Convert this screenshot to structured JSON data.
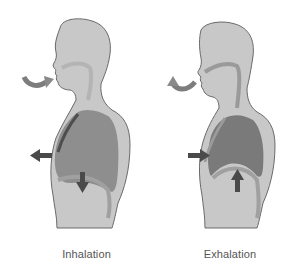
{
  "diagram": {
    "panels": [
      {
        "id": "inhalation",
        "caption": "Inhalation",
        "arrows": [
          {
            "name": "air-in",
            "direction": "into-mouth"
          },
          {
            "name": "ribcage",
            "direction": "outward"
          },
          {
            "name": "diaphragm",
            "direction": "down"
          }
        ]
      },
      {
        "id": "exhalation",
        "caption": "Exhalation",
        "arrows": [
          {
            "name": "air-out",
            "direction": "out-of-mouth"
          },
          {
            "name": "ribcage",
            "direction": "inward"
          },
          {
            "name": "diaphragm",
            "direction": "up"
          }
        ]
      }
    ],
    "colors": {
      "body_fill": "#c8c8c8",
      "body_outline": "#6a6a6a",
      "lung_fill_inhale": "#8e8e8e",
      "lung_fill_exhale": "#7a7a7a",
      "airway": "#a8a8a8",
      "arrow": "#4a4a4a",
      "caption_text": "#555555"
    }
  }
}
